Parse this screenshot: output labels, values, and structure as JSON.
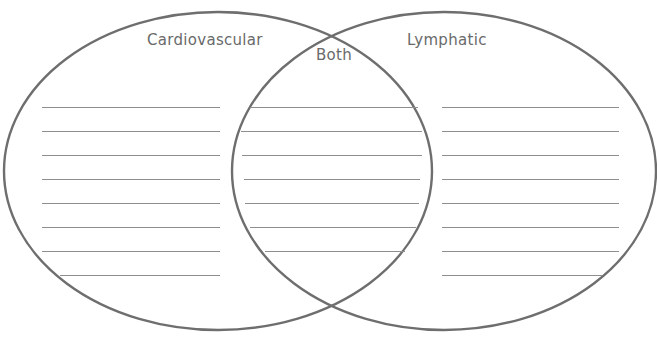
{
  "diagram": {
    "type": "venn",
    "circles": [
      {
        "id": "left",
        "label": "Cardiovascular",
        "cx": 218,
        "cy": 171,
        "rx": 214,
        "ry": 159
      },
      {
        "id": "right",
        "label": "Lymphatic",
        "cx": 444,
        "cy": 171,
        "rx": 212,
        "ry": 159
      }
    ],
    "overlap_label": "Both",
    "stroke_color": "#6e6e6e",
    "line_color": "#8e8e8e",
    "text_color": "#6a6a6a",
    "writing_lines_per_region": 8
  },
  "labels": {
    "left": "Cardiovascular",
    "right": "Lymphatic",
    "overlap": "Both"
  }
}
